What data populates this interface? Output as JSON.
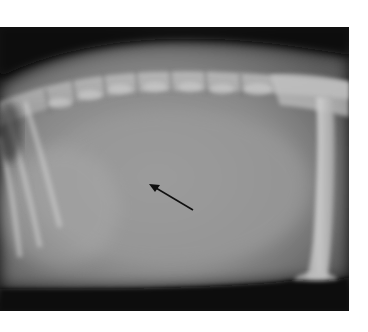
{
  "image": {
    "kind": "lateral abdominal radiograph",
    "annotation": {
      "type": "arrow",
      "color": "#101010",
      "tip": [
        149,
        157
      ],
      "tail": [
        193,
        183
      ]
    }
  }
}
